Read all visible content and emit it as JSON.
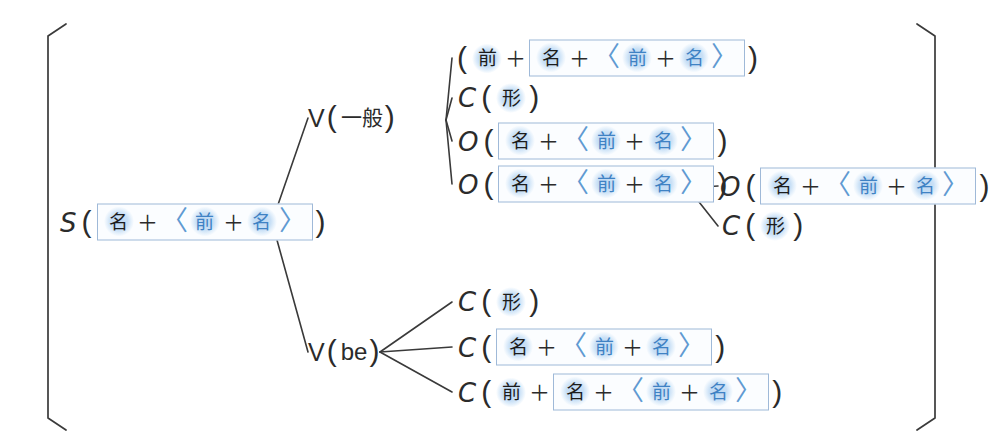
{
  "diagram": {
    "colors": {
      "ink": "#2b2b2b",
      "accent_blue": "#3f82c4",
      "halo_blue": "#c9e0f6",
      "box_border": "#9fb9d8"
    },
    "brackets": {
      "left": "[",
      "right": "]"
    },
    "symbols": {
      "plus": "＋",
      "paren_open": "(",
      "paren_close": ")",
      "angle_open": "〈",
      "angle_close": "〉"
    },
    "tokens": {
      "zen": "前",
      "mei": "名",
      "kei": "形"
    },
    "root": {
      "label": "S",
      "content": "名＋〈前＋名〉"
    },
    "branch_labels": {
      "v_ippan": {
        "letter": "V",
        "paren": "(一般)",
        "inner": "一般"
      },
      "v_be": {
        "letter": "V",
        "paren": "(be)",
        "inner": "be"
      }
    },
    "nodes": [
      {
        "id": "n1",
        "label": "",
        "text": "( 前 ＋ 名 ＋ 〈前 ＋ 名〉 )"
      },
      {
        "id": "n2",
        "label": "C",
        "text": "C ( 形 )"
      },
      {
        "id": "n3",
        "label": "O",
        "text": "O ( 名 ＋ 〈前 ＋ 名〉 )"
      },
      {
        "id": "n4",
        "label": "O",
        "text": "O ( 名 ＋ 〈前 ＋ 名〉 )"
      },
      {
        "id": "n5",
        "label": "O",
        "text": "O ( 名 ＋ 〈前 ＋ 名〉 )"
      },
      {
        "id": "n6",
        "label": "C",
        "text": "C ( 形 )"
      },
      {
        "id": "n7",
        "label": "C",
        "text": "C ( 形 )"
      },
      {
        "id": "n8",
        "label": "C",
        "text": "C ( 名 ＋ 〈前 ＋ 名〉 )"
      },
      {
        "id": "n9",
        "label": "C",
        "text": "C ( 前 ＋ 名 ＋ 〈前 ＋ 名〉 )"
      }
    ]
  }
}
